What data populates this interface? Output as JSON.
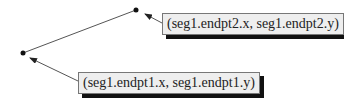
{
  "diagram": {
    "segment": {
      "name": "seg1",
      "endpoint1": {
        "x": 23,
        "y": 53
      },
      "endpoint2": {
        "x": 136,
        "y": 10
      },
      "line_color": "#555555",
      "point_color": "#111111"
    },
    "labels": {
      "endpoint2": "(seg1.endpt2.x, seg1.endpt2.y)",
      "endpoint1": "(seg1.endpt1.x, seg1.endpt1.y)"
    },
    "arrows": [
      {
        "from": {
          "x": 162,
          "y": 23
        },
        "to": {
          "x": 145,
          "y": 14
        },
        "points_to": "endpoint2"
      },
      {
        "from": {
          "x": 78,
          "y": 81
        },
        "to": {
          "x": 30,
          "y": 58
        },
        "points_to": "endpoint1"
      }
    ],
    "colors": {
      "label_background": "#eeeeee",
      "label_border": "#777777",
      "label_shadow": "#111111",
      "arrow": "#555555"
    }
  }
}
